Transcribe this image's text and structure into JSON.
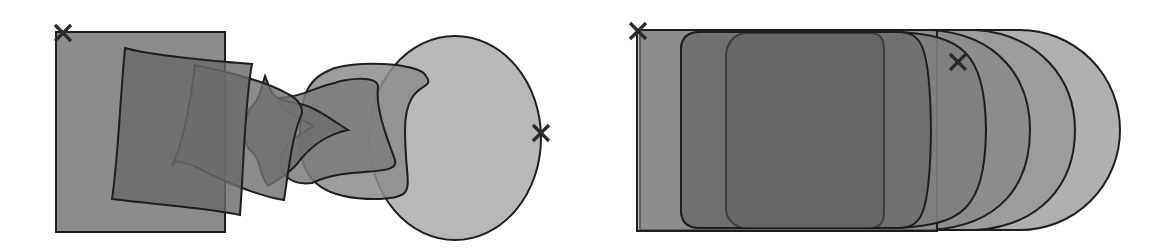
{
  "figure": {
    "panels": [
      {
        "id": "left",
        "label": "rotating morph",
        "colors": {
          "square": "#8a8a8a",
          "intermediate_dark": "#6a6a6a",
          "intermediate_mid": "#7c7c7c",
          "circle": "#b4b4b4",
          "stroke": "#1e1e1e"
        },
        "markers": [
          {
            "name": "start-marker",
            "x": 63,
            "y": 33
          },
          {
            "name": "end-marker",
            "x": 541,
            "y": 133
          }
        ]
      },
      {
        "id": "right",
        "label": "in-place morph",
        "colors": {
          "square": "#8e8e8e",
          "intermediate_dark": "#666666",
          "intermediate_mid": "#7a7a7a",
          "circle": "#b0b0b0",
          "stroke": "#1e1e1e"
        },
        "markers": [
          {
            "name": "start-marker",
            "x": 638,
            "y": 31
          },
          {
            "name": "end-marker",
            "x": 958,
            "y": 62
          }
        ]
      }
    ]
  }
}
